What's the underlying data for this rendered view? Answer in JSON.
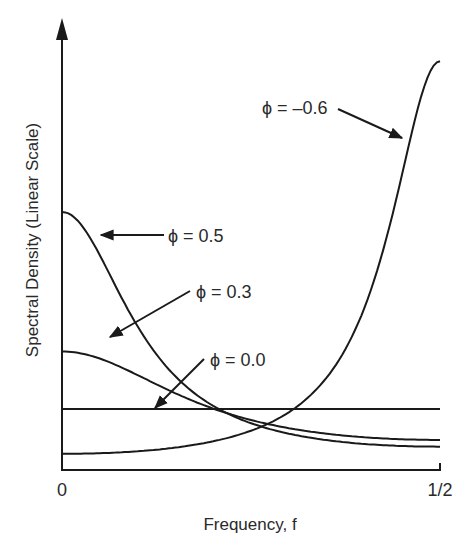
{
  "chart_data": {
    "type": "line",
    "title": "",
    "xlabel": "Frequency, f",
    "ylabel": "Spectral Density (Linear Scale)",
    "x_ticks": [
      "0",
      "1/2"
    ],
    "xlim": [
      0,
      0.5
    ],
    "grid": false,
    "legend": "none (curves labeled by inline arrows)",
    "model": "AR(1) spectrum S(f) = 1 / (1 + phi^2 - 2*phi*cos(2*pi*f))",
    "x": [
      0.0,
      0.05,
      0.1,
      0.15,
      0.2,
      0.25,
      0.3,
      0.35,
      0.4,
      0.45,
      0.5
    ],
    "series": [
      {
        "name": "φ = 0.5",
        "phi": 0.5,
        "values": [
          4.0,
          3.23,
          2.13,
          1.43,
          1.02,
          0.8,
          0.65,
          0.56,
          0.5,
          0.46,
          0.44
        ]
      },
      {
        "name": "φ = 0.3",
        "phi": 0.3,
        "values": [
          2.04,
          1.85,
          1.48,
          1.18,
          0.96,
          0.92,
          0.74,
          0.68,
          0.63,
          0.6,
          0.59
        ]
      },
      {
        "name": "φ = 0.0",
        "phi": 0.0,
        "values": [
          1.0,
          1.0,
          1.0,
          1.0,
          1.0,
          1.0,
          1.0,
          1.0,
          1.0,
          1.0,
          1.0
        ]
      },
      {
        "name": "φ = −0.6",
        "phi": -0.6,
        "values": [
          0.39,
          0.4,
          0.45,
          0.55,
          0.69,
          0.74,
          1.26,
          2.0,
          3.5,
          5.35,
          6.25
        ]
      }
    ],
    "annotations": [
      {
        "text": "φ = −0.6",
        "target_series": "φ = −0.6"
      },
      {
        "text": "φ = 0.5",
        "target_series": "φ = 0.5"
      },
      {
        "text": "φ = 0.3",
        "target_series": "φ = 0.3"
      },
      {
        "text": "φ = 0.0",
        "target_series": "φ = 0.0"
      }
    ]
  },
  "labels": {
    "ylabel": "Spectral Density (Linear Scale)",
    "xlabel": "Frequency, f",
    "tick_0": "0",
    "tick_half": "1/2",
    "ann_neg06": "ϕ = –0.6",
    "ann_05": "ϕ = 0.5",
    "ann_03": "ϕ = 0.3",
    "ann_00": "ϕ = 0.0"
  },
  "colors": {
    "ink": "#1a1a1a",
    "background": "#ffffff"
  }
}
